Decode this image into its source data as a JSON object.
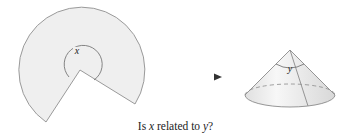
{
  "figure": {
    "sector": {
      "label": "x",
      "fill": "#efefef",
      "stroke": "#9a9a9a"
    },
    "arrow": {
      "color": "#333333"
    },
    "cone": {
      "label": "y",
      "fill": "#e8e8e8",
      "stroke": "#8a8a8a"
    }
  },
  "caption": {
    "prefix": "Is ",
    "var1": "x",
    "middle": " related to ",
    "var2": "y",
    "suffix": "?"
  }
}
